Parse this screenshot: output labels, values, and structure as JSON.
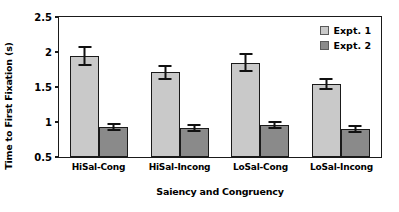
{
  "chart_data": {
    "type": "bar",
    "title": "",
    "xlabel": "Saiency and Congruency",
    "ylabel": "Time to First Fixation (s)",
    "categories": [
      "HiSal-Cong",
      "HiSal-Incong",
      "LoSal-Cong",
      "LoSal-Incong"
    ],
    "series": [
      {
        "name": "Expt. 1",
        "color": "#c9c9c9",
        "values": [
          1.94,
          1.71,
          1.85,
          1.54
        ],
        "errors": [
          0.14,
          0.11,
          0.13,
          0.09
        ]
      },
      {
        "name": "Expt. 2",
        "color": "#8a8a8a",
        "values": [
          0.93,
          0.91,
          0.96,
          0.9
        ],
        "errors": [
          0.06,
          0.06,
          0.06,
          0.06
        ]
      }
    ],
    "ylim": [
      0.5,
      2.5
    ],
    "yticks": [
      0.5,
      1,
      1.5,
      2,
      2.5
    ],
    "ytick_labels": [
      "0.5",
      "1",
      "1.5",
      "2",
      "2.5"
    ],
    "grid": false,
    "legend_position": "top-right"
  }
}
